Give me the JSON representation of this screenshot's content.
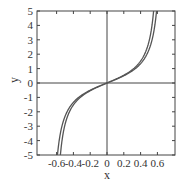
{
  "chart_data": {
    "type": "line",
    "title": "",
    "xlabel": "x",
    "ylabel": "y",
    "xlim": [
      -0.72,
      0.82
    ],
    "ylim": [
      -5,
      5
    ],
    "xticks": [
      -0.6,
      -0.4,
      -0.2,
      0,
      0.2,
      0.4,
      0.6
    ],
    "xtick_labels": [
      "-0.6",
      "-0.4",
      "-0.2",
      "0",
      "0.2",
      "0.4",
      "0.6"
    ],
    "yticks": [
      -5,
      -4,
      -3,
      -2,
      -1,
      0,
      1,
      2,
      3,
      4,
      5
    ],
    "ytick_labels": [
      "-5",
      "-4",
      "-3",
      "-2",
      "-1",
      "0",
      "1",
      "2",
      "3",
      "4",
      "5"
    ],
    "grid": false,
    "legend": null,
    "reference_lines": [
      "x=0",
      "y=0"
    ],
    "series": [
      {
        "name": "curve-1",
        "x": [
          -0.59,
          -0.55,
          -0.5,
          -0.4,
          -0.3,
          -0.2,
          -0.1,
          0,
          0.1,
          0.2,
          0.3,
          0.4,
          0.5,
          0.55,
          0.59
        ],
        "y": [
          -5.0,
          -3.2,
          -2.1,
          -1.2,
          -0.8,
          -0.5,
          -0.24,
          0,
          0.24,
          0.5,
          0.8,
          1.2,
          2.1,
          3.2,
          5.0
        ]
      },
      {
        "name": "curve-2",
        "x": [
          -0.555,
          -0.5,
          -0.45,
          -0.4,
          -0.3,
          -0.2,
          -0.1,
          0,
          0.1,
          0.2,
          0.3,
          0.4,
          0.45,
          0.5,
          0.555
        ],
        "y": [
          -5.0,
          -2.9,
          -2.0,
          -1.5,
          -0.9,
          -0.55,
          -0.26,
          0,
          0.26,
          0.55,
          0.9,
          1.5,
          2.0,
          2.9,
          5.0
        ]
      }
    ]
  },
  "labels": {
    "x": "x",
    "y": "y"
  },
  "colors": {
    "axis": "#444444",
    "curve": "#555555"
  }
}
